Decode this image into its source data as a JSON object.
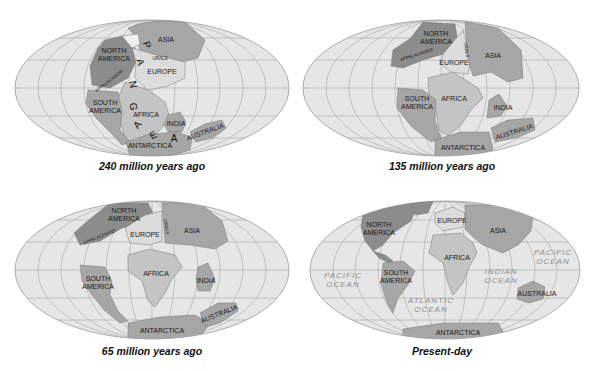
{
  "colors": {
    "ocean": "#e6e6e6",
    "grid": "#a8a8a8",
    "land_dark": "#8c8c8c",
    "land_medium": "#a6a6a6",
    "land_light": "#c4c4c4",
    "land_pale": "#dcdcdc",
    "ocean_label": "#8f8f8f"
  },
  "maps": [
    {
      "caption": "240 million years ago",
      "labels": {
        "asia": "ASIA",
        "north_america": [
          "NORTH",
          "AMERICA"
        ],
        "urals": "URALS",
        "europe": "EUROPE",
        "appalachians": "APPALACHIANS",
        "south_america": [
          "SOUTH",
          "AMERICA"
        ],
        "africa": "AFRICA",
        "india": "INDIA",
        "australia": "AUSTRALIA",
        "antarctica": "ANTARCTICA",
        "pangaea_letters": [
          "P",
          "A",
          "N",
          "G",
          "A",
          "E",
          "A"
        ]
      }
    },
    {
      "caption": "135 million years ago",
      "labels": {
        "north_america": [
          "NORTH",
          "AMERICA"
        ],
        "urals": "URALS",
        "appalachians": "APPALACHIANS",
        "asia": "ASIA",
        "europe": "EUROPE",
        "south_america": [
          "SOUTH",
          "AMERICA"
        ],
        "africa": "AFRICA",
        "india": "INDIA",
        "australia": "AUSTRALIA",
        "antarctica": "ANTARCTICA"
      }
    },
    {
      "caption": "65 million years ago",
      "labels": {
        "north_america": [
          "NORTH",
          "AMERICA"
        ],
        "urals": "URALS",
        "appalachians": "APPALACHIANS",
        "europe": "EUROPE",
        "asia": "ASIA",
        "africa": "AFRICA",
        "south_america": [
          "SOUTH",
          "AMERICA"
        ],
        "india": "INDIA",
        "australia": "AUSTRALIA",
        "antarctica": "ANTARCTICA"
      }
    },
    {
      "caption": "Present-day",
      "labels": {
        "north_america": [
          "NORTH",
          "AMERICA"
        ],
        "europe": "EUROPE",
        "asia": "ASIA",
        "africa": "AFRICA",
        "south_america": [
          "SOUTH",
          "AMERICA"
        ],
        "pacific_west": [
          "PACIFIC",
          "OCEAN"
        ],
        "pacific_east": [
          "PACIFIC",
          "OCEAN"
        ],
        "indian": [
          "INDIAN",
          "OCEAN"
        ],
        "atlantic": [
          "ATLANTIC",
          "OCEAN"
        ],
        "australia": "AUSTRALIA",
        "antarctica": "ANTARCTICA"
      }
    }
  ]
}
